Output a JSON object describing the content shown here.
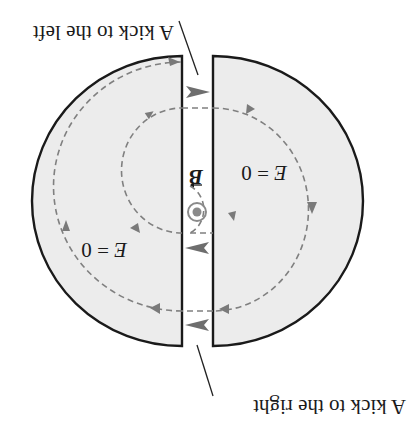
{
  "figure": {
    "orientation": "rotated 180 degrees",
    "labels": {
      "kick_left": "A kick to the left",
      "kick_right": "A kick to the right",
      "field_left_dee": "E = 0",
      "field_right_dee": "E = 0",
      "field_left_var": "E",
      "field_left_rest": " = 0",
      "field_right_var": "E",
      "field_right_rest": " = 0",
      "magnetic_field": "B",
      "magnetic_field_direction": "out of page (dot symbol)"
    },
    "colors": {
      "dee_fill": "#ececec",
      "dee_stroke": "#1a1a1a",
      "orbit": "#808080",
      "kick_arrow": "#6e6e6e",
      "b_symbol": "#8a8a8a"
    }
  }
}
